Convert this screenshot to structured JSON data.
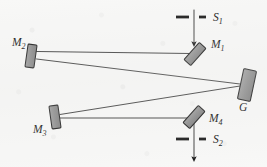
{
  "figure": {
    "background_color": "#f8f8f7",
    "ink_color": "#1a1a1a",
    "component_fill": "#8c8c8c",
    "component_stroke": "#1a1a1a"
  },
  "components": [
    {
      "id": "S1",
      "label": "S",
      "subscript": "1",
      "kind": "entrance-slit",
      "label_x": 213,
      "label_y": 21,
      "slit": {
        "cx": 194,
        "cy": 17,
        "gap": 5,
        "dash_len": 12,
        "thickness": 2.6
      },
      "arrow": {
        "x": 194,
        "y_start": 10,
        "y_end": 45
      }
    },
    {
      "id": "M1",
      "label": "M",
      "subscript": "1",
      "kind": "plane-mirror",
      "cx": 195,
      "cy": 54,
      "width": 9,
      "height": 23,
      "rotation_deg": 42,
      "label_x": 211,
      "label_y": 48
    },
    {
      "id": "M2",
      "label": "M",
      "subscript": "2",
      "kind": "plane-mirror",
      "cx": 31,
      "cy": 56,
      "width": 9,
      "height": 23,
      "rotation_deg": 8,
      "label_x": 12,
      "label_y": 46
    },
    {
      "id": "G",
      "label": "G",
      "subscript": "",
      "kind": "diffraction-grating",
      "cx": 247,
      "cy": 85,
      "width": 13,
      "height": 31,
      "rotation_deg": 12,
      "label_x": 240,
      "label_y": 110
    },
    {
      "id": "M3",
      "label": "M",
      "subscript": "3",
      "kind": "plane-mirror",
      "cx": 55,
      "cy": 117,
      "width": 9,
      "height": 23,
      "rotation_deg": -8,
      "label_x": 34,
      "label_y": 131
    },
    {
      "id": "M4",
      "label": "M",
      "subscript": "4",
      "kind": "plane-mirror",
      "cx": 194,
      "cy": 117,
      "width": 9,
      "height": 23,
      "rotation_deg": 42,
      "label_x": 209,
      "label_y": 121
    },
    {
      "id": "S2",
      "label": "S",
      "subscript": "2",
      "kind": "exit-slit",
      "label_x": 213,
      "label_y": 143,
      "slit": {
        "cx": 194,
        "cy": 139,
        "gap": 5,
        "dash_len": 12,
        "thickness": 2.6
      },
      "arrow": {
        "x": 194,
        "y_start": 139,
        "y_end": 160
      }
    }
  ],
  "beam_path": [
    {
      "name": "slit1-to-M1",
      "x1": 194,
      "y1": 10,
      "x2": 194,
      "y2": 45,
      "arrow": true
    },
    {
      "name": "M1-to-M2",
      "x1": 190,
      "y1": 54,
      "x2": 36,
      "y2": 52,
      "arrow": false
    },
    {
      "name": "M2-to-G",
      "x1": 36,
      "y1": 59,
      "x2": 240,
      "y2": 84,
      "arrow": false
    },
    {
      "name": "G-to-M3",
      "x1": 240,
      "y1": 86,
      "x2": 60,
      "y2": 115,
      "arrow": false
    },
    {
      "name": "M3-to-M4",
      "x1": 60,
      "y1": 118,
      "x2": 190,
      "y2": 118,
      "arrow": false
    },
    {
      "name": "M4-to-slit2",
      "x1": 194,
      "y1": 122,
      "x2": 194,
      "y2": 160,
      "arrow": true
    }
  ]
}
